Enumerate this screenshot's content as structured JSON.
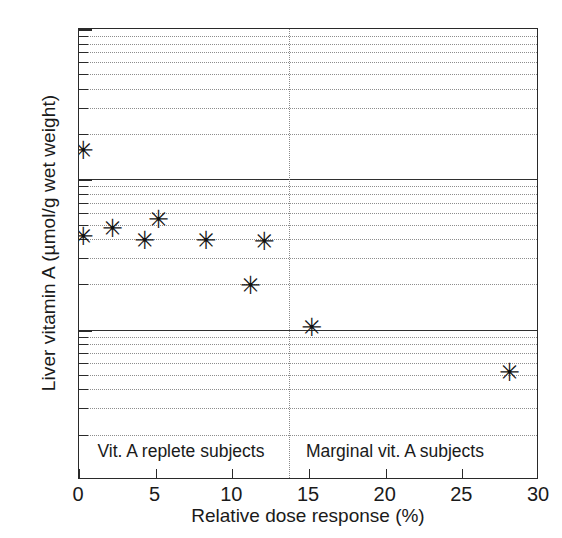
{
  "chart_data": {
    "type": "scatter",
    "title": "",
    "xlabel": "Relative dose response (%)",
    "ylabel": "Liver vitamin A (µmol/g wet weight)",
    "xlim": [
      0,
      30
    ],
    "ylim": [
      0.01,
      10
    ],
    "yscale": "log",
    "xscale": "linear",
    "grid": true,
    "legend": "none",
    "marker": "asterisk",
    "xticks": [
      0,
      5,
      10,
      15,
      20,
      25,
      30
    ],
    "xticklabels": [
      "0",
      "5",
      "10",
      "15",
      "20",
      "25",
      "30"
    ],
    "yticks": [
      10,
      1,
      0.1,
      0.01
    ],
    "yticklabels": [
      "10",
      "1",
      "0.1",
      "0.01"
    ],
    "points": [
      {
        "x": 0.2,
        "y": 1.5
      },
      {
        "x": 0.2,
        "y": 0.4
      },
      {
        "x": 2.1,
        "y": 0.45
      },
      {
        "x": 4.2,
        "y": 0.38
      },
      {
        "x": 5.1,
        "y": 0.52
      },
      {
        "x": 8.2,
        "y": 0.38
      },
      {
        "x": 11.1,
        "y": 0.19
      },
      {
        "x": 12.0,
        "y": 0.37
      },
      {
        "x": 15.1,
        "y": 0.1
      },
      {
        "x": 28.0,
        "y": 0.05
      }
    ],
    "annotations": [
      {
        "text": "Vit. A replete subjects",
        "x": 1.2,
        "y": 0.0155
      },
      {
        "text": "Marginal vit. A subjects",
        "x": 14.8,
        "y": 0.0155
      }
    ],
    "divider": {
      "x": 13.7,
      "style": "dotted",
      "label": "group separator"
    },
    "marker_glyph": "✳",
    "colors": {
      "marker": "#111111",
      "axis": "#2a2a2a",
      "grid_major": "#2f2f2f",
      "grid_minor": "#8d8d8d"
    }
  }
}
